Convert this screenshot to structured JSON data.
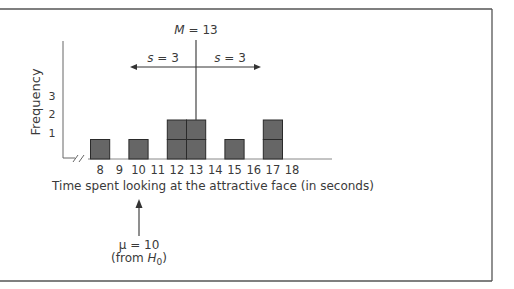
{
  "chart_data": {
    "type": "bar",
    "subtype": "frequency-histogram",
    "title": "",
    "xlabel": "Time spent looking at the attractive face (in seconds)",
    "ylabel": "Frequency",
    "categories": [
      "8",
      "9",
      "10",
      "11",
      "12",
      "13",
      "14",
      "15",
      "16",
      "17",
      "18"
    ],
    "values": [
      1,
      0,
      1,
      0,
      2,
      2,
      0,
      1,
      0,
      2,
      0
    ],
    "y_ticks": [
      "1",
      "2",
      "3"
    ],
    "ylim": [
      0,
      3
    ],
    "axis_break": true,
    "grid": false,
    "legend": null,
    "annotations": {
      "mean_label_prefix": "M",
      "mean_label_value": "= 13",
      "mean_value": 13,
      "sd_left_prefix": "s",
      "sd_left_value": "= 3",
      "sd_right_prefix": "s",
      "sd_right_value": "= 3",
      "sd": 3,
      "mu_symbol": "μ",
      "mu_value_text": "= 10",
      "mu_value": 10,
      "mu_source_prefix": "(from ",
      "mu_source_var": "H",
      "mu_source_sub": "0",
      "mu_source_suffix": ")"
    },
    "colors": {
      "bar_fill": "#666666",
      "bar_stroke": "#2a2a2a",
      "axis": "#555555",
      "frame": "#555555"
    }
  }
}
